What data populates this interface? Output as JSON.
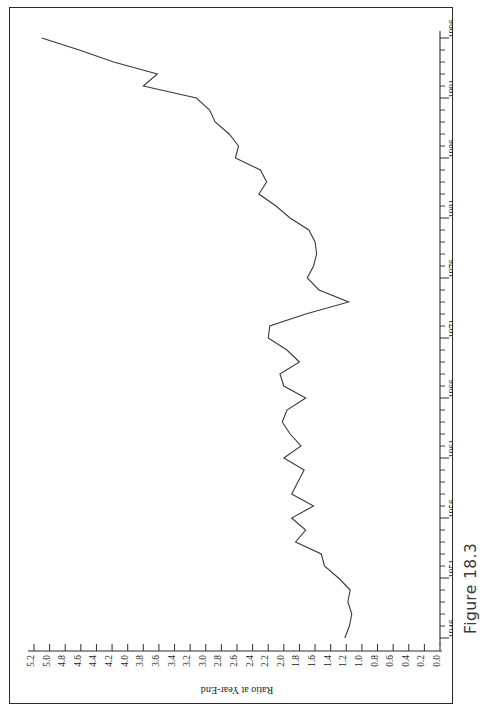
{
  "figure": {
    "caption": "Figure 18.3",
    "orientation": "rotated-90-ccw"
  },
  "colors": {
    "line": "#3a3a3a",
    "axis": "#2d2d2d",
    "frame": "#2a2a2a",
    "background": "#ffffff",
    "caption": "#3b3b3b"
  },
  "chart_data": {
    "type": "line",
    "title": "",
    "xlabel": "Year",
    "ylabel": "Ratio at Year-End",
    "xlim": [
      1946,
      1996
    ],
    "ylim": [
      0.0,
      5.2
    ],
    "grid": false,
    "legend": "none",
    "xticks": [
      1946,
      1951,
      1956,
      1961,
      1966,
      1971,
      1976,
      1981,
      1986,
      1991,
      1996
    ],
    "xtick_labels": [
      "1946",
      "1951",
      "1956",
      "1961",
      "1966",
      "1971",
      "1976",
      "1981",
      "1986",
      "1991",
      "1996"
    ],
    "xtick_minor_step": 1,
    "yticks": [
      0.0,
      0.2,
      0.4,
      0.6,
      0.8,
      1.0,
      1.2,
      1.4,
      1.6,
      1.8,
      2.0,
      2.2,
      2.4,
      2.6,
      2.8,
      3.0,
      3.2,
      3.4,
      3.6,
      3.8,
      4.0,
      4.2,
      4.4,
      4.6,
      4.8,
      5.0,
      5.2
    ],
    "ytick_labels": [
      "0.0",
      "0.2",
      "0.4",
      "0.6",
      "0.8",
      "1.0",
      "1.2",
      "1.4",
      "1.6",
      "1.8",
      "2.0",
      "2.2",
      "2.4",
      "2.6",
      "2.8",
      "3.0",
      "3.2",
      "3.4",
      "3.6",
      "3.8",
      "4.0",
      "4.2",
      "4.4",
      "4.6",
      "4.8",
      "5.0",
      "5.2"
    ],
    "x": [
      1946,
      1947,
      1948,
      1949,
      1950,
      1951,
      1952,
      1953,
      1954,
      1955,
      1956,
      1957,
      1958,
      1959,
      1960,
      1961,
      1962,
      1963,
      1964,
      1965,
      1966,
      1967,
      1968,
      1969,
      1970,
      1971,
      1972,
      1973,
      1974,
      1975,
      1976,
      1977,
      1978,
      1979,
      1980,
      1981,
      1982,
      1983,
      1984,
      1985,
      1986,
      1987,
      1988,
      1989,
      1990,
      1991,
      1992,
      1993,
      1994,
      1995,
      1996
    ],
    "values": [
      1.22,
      1.16,
      1.13,
      1.18,
      1.15,
      1.3,
      1.48,
      1.52,
      1.85,
      1.72,
      1.9,
      1.62,
      1.9,
      1.82,
      1.74,
      2.0,
      1.78,
      1.92,
      2.02,
      1.96,
      1.72,
      2.0,
      2.05,
      1.8,
      1.96,
      2.2,
      2.18,
      1.72,
      1.17,
      1.55,
      1.7,
      1.62,
      1.58,
      1.6,
      1.68,
      1.92,
      2.1,
      2.32,
      2.22,
      2.3,
      2.62,
      2.58,
      2.7,
      2.88,
      2.95,
      3.12,
      3.8,
      3.62,
      4.18,
      4.62,
      5.1
    ],
    "series": [
      {
        "name": "Ratio at Year-End",
        "values": [
          1.22,
          1.16,
          1.13,
          1.18,
          1.15,
          1.3,
          1.48,
          1.52,
          1.85,
          1.72,
          1.9,
          1.62,
          1.9,
          1.82,
          1.74,
          2.0,
          1.78,
          1.92,
          2.02,
          1.96,
          1.72,
          2.0,
          2.05,
          1.8,
          1.96,
          2.2,
          2.18,
          1.72,
          1.17,
          1.55,
          1.7,
          1.62,
          1.58,
          1.6,
          1.68,
          1.92,
          2.1,
          2.32,
          2.22,
          2.3,
          2.62,
          2.58,
          2.7,
          2.88,
          2.95,
          3.12,
          3.8,
          3.62,
          4.18,
          4.62,
          5.1
        ]
      }
    ]
  }
}
